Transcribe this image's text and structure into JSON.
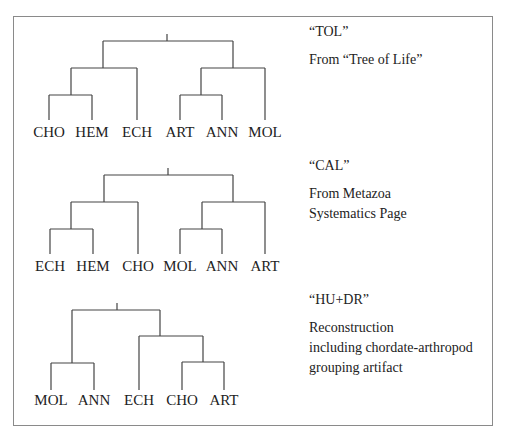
{
  "panels": [
    {
      "name": "“TOL”",
      "description_lines": [
        "From “Tree of Life”"
      ],
      "leaves": [
        "CHO",
        "HEM",
        "ECH",
        "ART",
        "ANN",
        "MOL"
      ],
      "topology": "(((CHO,HEM),ECH),((ART,ANN),MOL))"
    },
    {
      "name": "“CAL”",
      "description_lines": [
        "From Metazoa",
        "Systematics Page"
      ],
      "leaves": [
        "ECH",
        "HEM",
        "CHO",
        "MOL",
        "ANN",
        "ART"
      ],
      "topology": "(((ECH,HEM),CHO),((MOL,ANN),ART))"
    },
    {
      "name": "“HU+DR”",
      "description_lines": [
        "Reconstruction",
        "including chordate-arthropod",
        "grouping artifact"
      ],
      "leaves": [
        "MOL",
        "ANN",
        "ECH",
        "CHO",
        "ART"
      ],
      "topology": "((MOL,ANN),(ECH,(CHO,ART)))"
    }
  ]
}
